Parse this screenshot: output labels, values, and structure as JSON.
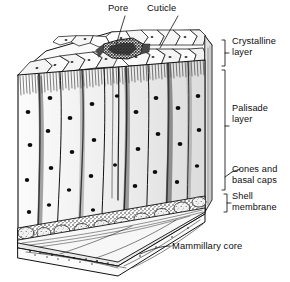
{
  "figure": {
    "kind": "eggshell-cross-section-diagram",
    "style": "pen-and-ink line drawing, black on white",
    "background_color": "#ffffff",
    "ink_color": "#111111",
    "fill_color": "#ebebeb"
  },
  "labels": {
    "pore": "Pore",
    "cuticle": "Cuticle",
    "crystalline_layer_line1": "Crystalline",
    "crystalline_layer_line2": "layer",
    "palisade_layer_line1": "Palisade",
    "palisade_layer_line2": "layer",
    "cones_line1": "Cones and",
    "cones_line2": "basal caps",
    "shell_membrane_line1": "Shell",
    "shell_membrane_line2": "membrane",
    "mammillary_core": "Mammillary core"
  },
  "brackets": [
    {
      "name": "crystalline-layer-bracket",
      "label": "Crystalline layer"
    },
    {
      "name": "palisade-layer-bracket",
      "label": "Palisade layer"
    },
    {
      "name": "cones-and-basal-caps-bracket",
      "label": "Cones and basal caps"
    },
    {
      "name": "shell-membrane-bracket",
      "label": "Shell membrane"
    }
  ],
  "leaders": [
    {
      "name": "pore-leader",
      "label": "Pore"
    },
    {
      "name": "cuticle-leader",
      "label": "Cuticle"
    },
    {
      "name": "mammillary-core-leader",
      "label": "Mammillary core"
    }
  ],
  "structures": {
    "top_face": "polygonal cuticle cells in perspective",
    "pore_region": "dark stippled pore opening at top center",
    "palisade_columns": 9,
    "inclusions": "black elliptical vesicles scattered in palisade columns",
    "base": "mammillary cones and shell membrane layers at bottom"
  }
}
